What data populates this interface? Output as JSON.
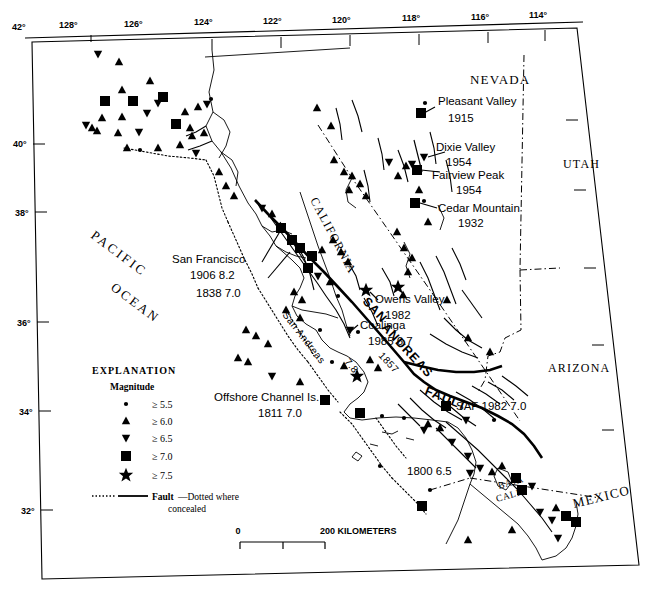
{
  "map": {
    "title": "Historical earthquakes of California and Nevada",
    "longitude_labels": [
      "128°",
      "126°",
      "124°",
      "122°",
      "120°",
      "118°",
      "116°",
      "114°"
    ],
    "latitude_labels": [
      "42°",
      "40°",
      "38°",
      "36°",
      "34°",
      "32°"
    ],
    "regions": [
      {
        "name": "NEVADA",
        "x": 470,
        "y": 84,
        "rotate": 0,
        "style": "region"
      },
      {
        "name": "UTAH",
        "x": 563,
        "y": 168,
        "rotate": 0,
        "style": "region"
      },
      {
        "name": "ARIZONA",
        "x": 548,
        "y": 372,
        "rotate": 0,
        "style": "region"
      },
      {
        "name": "CALIFORNIA",
        "x": 310,
        "y": 200,
        "rotate": 62,
        "style": "region"
      },
      {
        "name": "MEXICO",
        "x": 574,
        "y": 508,
        "rotate": -14,
        "style": "region"
      },
      {
        "name": "PACIFIC",
        "x": 90,
        "y": 237,
        "rotate": 37,
        "style": "ocean"
      },
      {
        "name": "OCEAN",
        "x": 110,
        "y": 289,
        "rotate": 37,
        "style": "ocean"
      },
      {
        "name": "BAJA",
        "x": 499,
        "y": 489,
        "rotate": -16,
        "style": "baja"
      },
      {
        "name": "CALIF",
        "x": 497,
        "y": 501,
        "rotate": -16,
        "style": "baja"
      }
    ],
    "fault_labels": [
      {
        "name": "SAN",
        "x": 362,
        "y": 302,
        "rotate": 47
      },
      {
        "name": "ANDREAS",
        "x": 381,
        "y": 328,
        "rotate": 47
      },
      {
        "name": "FAULT",
        "x": 424,
        "y": 394,
        "rotate": 22
      },
      {
        "name": "San Andreas",
        "x": 282,
        "y": 315,
        "rotate": 52
      },
      {
        "name": "1857",
        "x": 378,
        "y": 356,
        "rotate": 47
      },
      {
        "name": "7.8",
        "x": 344,
        "y": 362,
        "rotate": 50
      }
    ],
    "annotations": [
      {
        "id": "san-francisco",
        "lines": [
          "San Francisco",
          "1906  8.2",
          "1838  7.0"
        ],
        "x": 172,
        "y": 263,
        "align": "start"
      },
      {
        "id": "pleasant-valley",
        "lines": [
          "Pleasant Valley",
          "1915"
        ],
        "x": 438,
        "y": 101,
        "align": "start"
      },
      {
        "id": "dixie-valley",
        "lines": [
          "Dixie Valley",
          "1954"
        ],
        "x": 436,
        "y": 148,
        "align": "start"
      },
      {
        "id": "fairview-peak",
        "lines": [
          "Fairview Peak",
          "1954"
        ],
        "x": 430,
        "y": 176,
        "align": "start"
      },
      {
        "id": "cedar-mountain",
        "lines": [
          "Cedar Mountain",
          "1932"
        ],
        "x": 438,
        "y": 211,
        "align": "start"
      },
      {
        "id": "owens-valley",
        "lines": [
          "Owens Valley",
          "1982"
        ],
        "x": 375,
        "y": 303,
        "align": "start"
      },
      {
        "id": "coalinga",
        "lines": [
          "Coalinga",
          "1985  6.7"
        ],
        "x": 358,
        "y": 327,
        "align": "start"
      },
      {
        "id": "offshore-channel-islands",
        "lines": [
          "Offshore Channel Is.",
          "1811  7.0"
        ],
        "x": 214,
        "y": 400,
        "align": "start"
      },
      {
        "id": "saf-1982",
        "lines": [
          "SAF  1982 7.0"
        ],
        "x": 455,
        "y": 408,
        "align": "start"
      },
      {
        "id": "eq-1800",
        "lines": [
          "1800  6.5"
        ],
        "x": 407,
        "y": 473,
        "align": "start"
      }
    ],
    "legend": {
      "title": "EXPLANATION",
      "subtitle": "Magnitude",
      "items": [
        {
          "symbol": "circle",
          "label": "≥ 5.5"
        },
        {
          "symbol": "triangle-up",
          "label": "≥ 6.0"
        },
        {
          "symbol": "triangle-down",
          "label": "≥ 6.5"
        },
        {
          "symbol": "square",
          "label": "≥ 7.0"
        },
        {
          "symbol": "star",
          "label": "≥ 7.5"
        }
      ],
      "fault_label_bold": "Fault",
      "fault_label_rest": "—Dotted where",
      "fault_label_line2": "concealed"
    },
    "scale": {
      "zero": "0",
      "max": "200 KILOMETERS"
    },
    "colors": {
      "ink": "#000000",
      "paper": "#ffffff"
    }
  },
  "chart_data": {
    "type": "scatter",
    "xlabel": "Longitude",
    "ylabel": "Latitude",
    "xlim": [
      -128,
      -114
    ],
    "ylim": [
      32,
      42
    ],
    "legend": [
      "≥ 5.5",
      "≥ 6.0",
      "≥ 6.5",
      "≥ 7.0",
      "≥ 7.5"
    ],
    "epicenters": [
      {
        "x": 98,
        "y": 54,
        "m": "6.5"
      },
      {
        "x": 119,
        "y": 62,
        "m": "6.0"
      },
      {
        "x": 122,
        "y": 90,
        "m": "6.0"
      },
      {
        "x": 150,
        "y": 81,
        "m": "6.0"
      },
      {
        "x": 105,
        "y": 101,
        "m": "7.0"
      },
      {
        "x": 133,
        "y": 101,
        "m": "7.0"
      },
      {
        "x": 163,
        "y": 97,
        "m": "7.0"
      },
      {
        "x": 158,
        "y": 103,
        "m": "6.5"
      },
      {
        "x": 102,
        "y": 118,
        "m": "6.0"
      },
      {
        "x": 122,
        "y": 117,
        "m": "6.0"
      },
      {
        "x": 147,
        "y": 113,
        "m": "6.5"
      },
      {
        "x": 185,
        "y": 112,
        "m": "6.0"
      },
      {
        "x": 198,
        "y": 107,
        "m": "6.0"
      },
      {
        "x": 207,
        "y": 104,
        "m": "6.5"
      },
      {
        "x": 211,
        "y": 99,
        "m": "5.5"
      },
      {
        "x": 86,
        "y": 125,
        "m": "6.5"
      },
      {
        "x": 92,
        "y": 128,
        "m": "6.0"
      },
      {
        "x": 97,
        "y": 131,
        "m": "6.0"
      },
      {
        "x": 118,
        "y": 133,
        "m": "6.0"
      },
      {
        "x": 139,
        "y": 132,
        "m": "6.5"
      },
      {
        "x": 176,
        "y": 124,
        "m": "7.0"
      },
      {
        "x": 190,
        "y": 128,
        "m": "6.0"
      },
      {
        "x": 192,
        "y": 136,
        "m": "6.0"
      },
      {
        "x": 204,
        "y": 133,
        "m": "6.0"
      },
      {
        "x": 127,
        "y": 148,
        "m": "6.0"
      },
      {
        "x": 140,
        "y": 150,
        "m": "5.5"
      },
      {
        "x": 158,
        "y": 148,
        "m": "6.0"
      },
      {
        "x": 180,
        "y": 145,
        "m": "6.0"
      },
      {
        "x": 196,
        "y": 153,
        "m": "6.5"
      },
      {
        "x": 219,
        "y": 172,
        "m": "6.0"
      },
      {
        "x": 226,
        "y": 186,
        "m": "6.0"
      },
      {
        "x": 234,
        "y": 196,
        "m": "6.0"
      },
      {
        "x": 317,
        "y": 108,
        "m": "6.0"
      },
      {
        "x": 331,
        "y": 126,
        "m": "6.0"
      },
      {
        "x": 334,
        "y": 160,
        "m": "6.0"
      },
      {
        "x": 344,
        "y": 172,
        "m": "6.0"
      },
      {
        "x": 352,
        "y": 176,
        "m": "6.0"
      },
      {
        "x": 360,
        "y": 184,
        "m": "6.0"
      },
      {
        "x": 349,
        "y": 190,
        "m": "6.0"
      },
      {
        "x": 366,
        "y": 196,
        "m": "6.0"
      },
      {
        "x": 389,
        "y": 162,
        "m": "6.5"
      },
      {
        "x": 398,
        "y": 176,
        "m": "6.0"
      },
      {
        "x": 406,
        "y": 166,
        "m": "6.0"
      },
      {
        "x": 425,
        "y": 103,
        "m": "5.5"
      },
      {
        "x": 421,
        "y": 113,
        "m": "7.0"
      },
      {
        "x": 424,
        "y": 157,
        "m": "6.5"
      },
      {
        "x": 417,
        "y": 170,
        "m": "7.0"
      },
      {
        "x": 412,
        "y": 164,
        "m": "6.5"
      },
      {
        "x": 419,
        "y": 190,
        "m": "6.0"
      },
      {
        "x": 415,
        "y": 203,
        "m": "7.0"
      },
      {
        "x": 424,
        "y": 201,
        "m": "5.5"
      },
      {
        "x": 428,
        "y": 222,
        "m": "6.0"
      },
      {
        "x": 397,
        "y": 232,
        "m": "6.0"
      },
      {
        "x": 404,
        "y": 248,
        "m": "6.0"
      },
      {
        "x": 412,
        "y": 258,
        "m": "6.0"
      },
      {
        "x": 408,
        "y": 272,
        "m": "6.0"
      },
      {
        "x": 398,
        "y": 287,
        "m": "7.5"
      },
      {
        "x": 403,
        "y": 295,
        "m": "6.0"
      },
      {
        "x": 447,
        "y": 300,
        "m": "6.0"
      },
      {
        "x": 468,
        "y": 338,
        "m": "6.0"
      },
      {
        "x": 490,
        "y": 352,
        "m": "6.0"
      },
      {
        "x": 262,
        "y": 208,
        "m": "6.5"
      },
      {
        "x": 272,
        "y": 214,
        "m": "6.0"
      },
      {
        "x": 281,
        "y": 228,
        "m": "7.0"
      },
      {
        "x": 292,
        "y": 240,
        "m": "7.0"
      },
      {
        "x": 300,
        "y": 248,
        "m": "7.0"
      },
      {
        "x": 312,
        "y": 256,
        "m": "7.0"
      },
      {
        "x": 322,
        "y": 250,
        "m": "6.0"
      },
      {
        "x": 333,
        "y": 240,
        "m": "6.0"
      },
      {
        "x": 341,
        "y": 252,
        "m": "6.0"
      },
      {
        "x": 348,
        "y": 262,
        "m": "6.0"
      },
      {
        "x": 308,
        "y": 268,
        "m": "7.0"
      },
      {
        "x": 318,
        "y": 276,
        "m": "6.5"
      },
      {
        "x": 330,
        "y": 282,
        "m": "6.0"
      },
      {
        "x": 338,
        "y": 296,
        "m": "5.5"
      },
      {
        "x": 294,
        "y": 292,
        "m": "6.0"
      },
      {
        "x": 302,
        "y": 300,
        "m": "6.0"
      },
      {
        "x": 286,
        "y": 310,
        "m": "6.0"
      },
      {
        "x": 300,
        "y": 318,
        "m": "6.0"
      },
      {
        "x": 320,
        "y": 330,
        "m": "5.5"
      },
      {
        "x": 350,
        "y": 330,
        "m": "6.5"
      },
      {
        "x": 358,
        "y": 332,
        "m": "5.5"
      },
      {
        "x": 366,
        "y": 290,
        "m": "7.5"
      },
      {
        "x": 370,
        "y": 360,
        "m": "6.0"
      },
      {
        "x": 378,
        "y": 368,
        "m": "6.0"
      },
      {
        "x": 357,
        "y": 376,
        "m": "7.5"
      },
      {
        "x": 325,
        "y": 400,
        "m": "7.0"
      },
      {
        "x": 360,
        "y": 413,
        "m": "7.0"
      },
      {
        "x": 382,
        "y": 416,
        "m": "5.5"
      },
      {
        "x": 404,
        "y": 418,
        "m": "5.5"
      },
      {
        "x": 446,
        "y": 406,
        "m": "7.0"
      },
      {
        "x": 466,
        "y": 420,
        "m": "6.5"
      },
      {
        "x": 494,
        "y": 420,
        "m": "5.5"
      },
      {
        "x": 428,
        "y": 424,
        "m": "6.0"
      },
      {
        "x": 440,
        "y": 428,
        "m": "6.0"
      },
      {
        "x": 424,
        "y": 430,
        "m": "6.5"
      },
      {
        "x": 452,
        "y": 442,
        "m": "6.5"
      },
      {
        "x": 468,
        "y": 456,
        "m": "6.5"
      },
      {
        "x": 480,
        "y": 468,
        "m": "6.5"
      },
      {
        "x": 492,
        "y": 472,
        "m": "6.0"
      },
      {
        "x": 502,
        "y": 466,
        "m": "6.0"
      },
      {
        "x": 516,
        "y": 478,
        "m": "7.0"
      },
      {
        "x": 522,
        "y": 490,
        "m": "7.0"
      },
      {
        "x": 532,
        "y": 486,
        "m": "6.5"
      },
      {
        "x": 470,
        "y": 473,
        "m": "6.5"
      },
      {
        "x": 380,
        "y": 466,
        "m": "5.5"
      },
      {
        "x": 430,
        "y": 490,
        "m": "5.5"
      },
      {
        "x": 422,
        "y": 506,
        "m": "7.0"
      },
      {
        "x": 540,
        "y": 512,
        "m": "6.5"
      },
      {
        "x": 552,
        "y": 520,
        "m": "6.5"
      },
      {
        "x": 556,
        "y": 508,
        "m": "6.0"
      },
      {
        "x": 566,
        "y": 516,
        "m": "7.0"
      },
      {
        "x": 576,
        "y": 522,
        "m": "7.0"
      },
      {
        "x": 558,
        "y": 538,
        "m": "6.5"
      },
      {
        "x": 512,
        "y": 530,
        "m": "6.0"
      },
      {
        "x": 468,
        "y": 540,
        "m": "6.0"
      },
      {
        "x": 246,
        "y": 330,
        "m": "6.0"
      },
      {
        "x": 256,
        "y": 336,
        "m": "6.0"
      },
      {
        "x": 268,
        "y": 344,
        "m": "6.0"
      },
      {
        "x": 238,
        "y": 358,
        "m": "6.0"
      },
      {
        "x": 248,
        "y": 362,
        "m": "6.0"
      },
      {
        "x": 272,
        "y": 376,
        "m": "6.5"
      },
      {
        "x": 300,
        "y": 382,
        "m": "6.0"
      },
      {
        "x": 332,
        "y": 362,
        "m": "5.5"
      },
      {
        "x": 344,
        "y": 366,
        "m": "6.0"
      }
    ]
  }
}
